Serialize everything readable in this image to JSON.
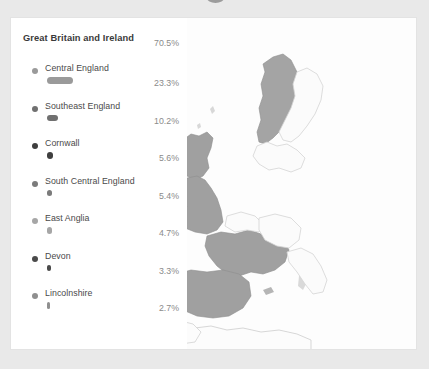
{
  "panel": {
    "region": {
      "label": "Great Britain and Ireland",
      "percent": "70.5%",
      "value": 70.5
    },
    "subregions": [
      {
        "label": "Central England",
        "percent": "23.3%",
        "value": 23.3,
        "dot_color": "#9a9a9a",
        "bar_color": "#9a9a9a",
        "bar_width": 26
      },
      {
        "label": "Southeast England",
        "percent": "10.2%",
        "value": 10.2,
        "dot_color": "#707070",
        "bar_color": "#707070",
        "bar_width": 11
      },
      {
        "label": "Cornwall",
        "percent": "5.6%",
        "value": 5.6,
        "dot_color": "#3f3f3f",
        "bar_color": "#3f3f3f",
        "bar_width": 6
      },
      {
        "label": "South Central England",
        "percent": "5.4%",
        "value": 5.4,
        "dot_color": "#7b7b7b",
        "bar_color": "#7b7b7b",
        "bar_width": 5
      },
      {
        "label": "East Anglia",
        "percent": "4.7%",
        "value": 4.7,
        "dot_color": "#a6a6a6",
        "bar_color": "#a6a6a6",
        "bar_width": 4.5
      },
      {
        "label": "Devon",
        "percent": "3.3%",
        "value": 3.3,
        "dot_color": "#4a4a4a",
        "bar_color": "#4a4a4a",
        "bar_width": 3.5
      },
      {
        "label": "Lincolnshire",
        "percent": "2.7%",
        "value": 2.7,
        "dot_color": "#8f8f8f",
        "bar_color": "#8f8f8f",
        "bar_width": 3
      }
    ]
  },
  "map": {
    "highlight_color": "#a0a0a0",
    "outline_color": "#d2d2d2",
    "ocean_color": "#fdfdfd",
    "highlighted_regions": [
      "Great Britain",
      "Ireland",
      "France",
      "Spain",
      "Portugal",
      "Norway"
    ],
    "outlined_regions": [
      "Greenland",
      "Iceland",
      "Scandinavia",
      "Low Countries",
      "Germany",
      "Italy",
      "North Africa"
    ]
  },
  "chart_data": {
    "type": "bar",
    "title": "Great Britain and Ireland",
    "categories": [
      "Central England",
      "Southeast England",
      "Cornwall",
      "South Central England",
      "East Anglia",
      "Devon",
      "Lincolnshire"
    ],
    "values": [
      23.3,
      10.2,
      5.6,
      5.4,
      4.7,
      3.3,
      2.7
    ],
    "total": 70.5,
    "unit": "%",
    "xlabel": "",
    "ylabel": "",
    "ylim": [
      0,
      23.3
    ],
    "legend": "none",
    "grid": false
  }
}
